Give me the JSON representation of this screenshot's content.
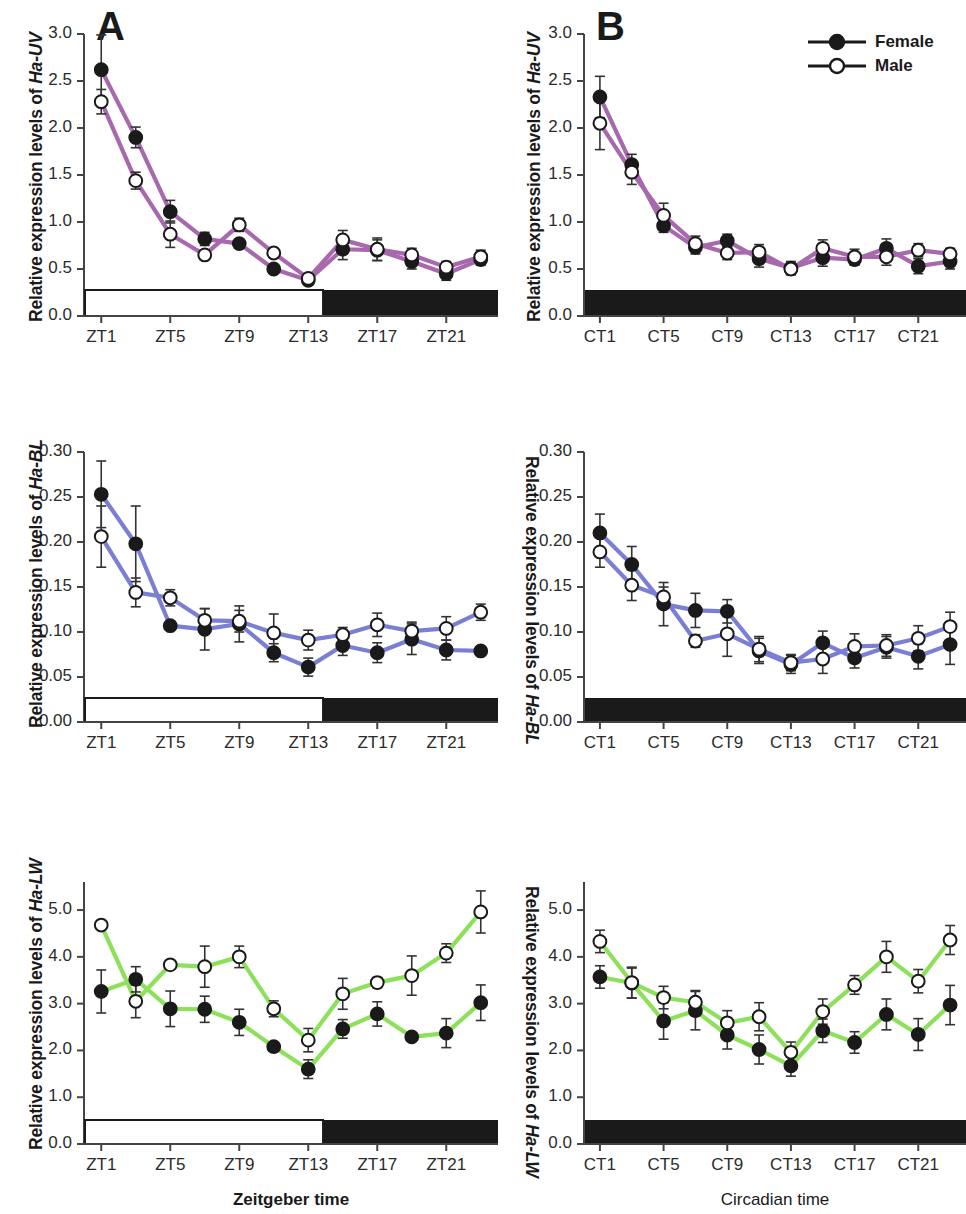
{
  "figure": {
    "panels": [
      {
        "id": "A",
        "letter": "A",
        "column": "left"
      },
      {
        "id": "B",
        "letter": "B",
        "column": "right"
      }
    ],
    "legend": {
      "position": "top-right of panel B",
      "entries": [
        {
          "label": "Female",
          "marker": "filled-circle"
        },
        {
          "label": "Male",
          "marker": "open-circle"
        }
      ]
    },
    "xlabels": {
      "left": "Zeitgeber time",
      "right": "Circadian time"
    },
    "ylabel_prefix": "Relative expression levels of"
  },
  "chart_data": [
    {
      "id": "A-UV",
      "type": "line",
      "panel": "A",
      "title": "",
      "gene": "Ha-UV",
      "ylabel": "Relative expression levels of Ha-UV",
      "xlabel": "Zeitgeber time",
      "line_color": "#a868ad",
      "ylim": [
        0.0,
        3.0
      ],
      "yticks": [
        "0.0",
        "0.5",
        "1.0",
        "1.5",
        "2.0",
        "2.5",
        "3.0"
      ],
      "ytick_values": [
        0.0,
        0.5,
        1.0,
        1.5,
        2.0,
        2.5,
        3.0
      ],
      "x": [
        1,
        3,
        5,
        7,
        9,
        11,
        13,
        15,
        17,
        19,
        21,
        23
      ],
      "xtick_labels": [
        "ZT1",
        "ZT5",
        "ZT9",
        "ZT13",
        "ZT17",
        "ZT21"
      ],
      "xtick_values": [
        1,
        5,
        9,
        13,
        17,
        21
      ],
      "grid": false,
      "daybar": {
        "light_until": 13.8,
        "light_color": "#ffffff",
        "dark_color": "#1a1a1a"
      },
      "series": [
        {
          "name": "Female",
          "marker": "filled-circle",
          "values": [
            2.62,
            1.9,
            1.11,
            0.82,
            0.77,
            0.5,
            0.38,
            0.71,
            0.7,
            0.58,
            0.45,
            0.6
          ],
          "errors": [
            0.37,
            0.11,
            0.12,
            0.07,
            0.05,
            0.04,
            0.03,
            0.11,
            0.11,
            0.08,
            0.07,
            0.06
          ]
        },
        {
          "name": "Male",
          "marker": "open-circle",
          "values": [
            2.28,
            1.44,
            0.87,
            0.65,
            0.97,
            0.67,
            0.4,
            0.81,
            0.71,
            0.65,
            0.52,
            0.63
          ],
          "errors": [
            0.13,
            0.09,
            0.14,
            0.05,
            0.07,
            0.05,
            0.04,
            0.1,
            0.12,
            0.07,
            0.06,
            0.07
          ]
        }
      ]
    },
    {
      "id": "B-UV",
      "type": "line",
      "panel": "B",
      "gene": "Ha-UV",
      "ylabel": "Relative expression levels of Ha-UV",
      "xlabel": "Circadian time",
      "line_color": "#a868ad",
      "ylim": [
        0.0,
        3.0
      ],
      "yticks": [
        "0.0",
        "0.5",
        "1.0",
        "1.5",
        "2.0",
        "2.5",
        "3.0"
      ],
      "ytick_values": [
        0.0,
        0.5,
        1.0,
        1.5,
        2.0,
        2.5,
        3.0
      ],
      "x": [
        1,
        3,
        5,
        7,
        9,
        11,
        13,
        15,
        17,
        19,
        21,
        23
      ],
      "xtick_labels": [
        "CT1",
        "CT5",
        "CT9",
        "CT13",
        "CT17",
        "CT21"
      ],
      "xtick_values": [
        1,
        5,
        9,
        13,
        17,
        21
      ],
      "grid": false,
      "daybar": {
        "light_until": 0,
        "light_color": "#ffffff",
        "dark_color": "#1a1a1a"
      },
      "series": [
        {
          "name": "Female",
          "marker": "filled-circle",
          "values": [
            2.33,
            1.61,
            0.96,
            0.73,
            0.8,
            0.61,
            0.51,
            0.62,
            0.6,
            0.72,
            0.53,
            0.58
          ],
          "errors": [
            0.22,
            0.11,
            0.07,
            0.07,
            0.07,
            0.09,
            0.07,
            0.09,
            0.06,
            0.1,
            0.08,
            0.08
          ]
        },
        {
          "name": "Male",
          "marker": "open-circle",
          "values": [
            2.05,
            1.53,
            1.07,
            0.77,
            0.67,
            0.68,
            0.5,
            0.72,
            0.63,
            0.63,
            0.7,
            0.66
          ],
          "errors": [
            0.28,
            0.13,
            0.13,
            0.08,
            0.07,
            0.08,
            0.06,
            0.09,
            0.08,
            0.09,
            0.07,
            0.06
          ]
        }
      ]
    },
    {
      "id": "A-BL",
      "type": "line",
      "panel": "A",
      "gene": "Ha-BL",
      "ylabel": "Relative expression levels of Ha-BL",
      "xlabel": "Zeitgeber time",
      "line_color": "#7b7fd4",
      "ylim": [
        0.0,
        0.3
      ],
      "yticks": [
        "0.00",
        "0.05",
        "0.10",
        "0.15",
        "0.20",
        "0.25",
        "0.30"
      ],
      "ytick_values": [
        0.0,
        0.05,
        0.1,
        0.15,
        0.2,
        0.25,
        0.3
      ],
      "x": [
        1,
        3,
        5,
        7,
        9,
        11,
        13,
        15,
        17,
        19,
        21,
        23
      ],
      "xtick_labels": [
        "ZT1",
        "ZT5",
        "ZT9",
        "ZT13",
        "ZT17",
        "ZT21"
      ],
      "xtick_values": [
        1,
        5,
        9,
        13,
        17,
        21
      ],
      "grid": false,
      "daybar": {
        "light_until": 13.8,
        "light_color": "#ffffff",
        "dark_color": "#1a1a1a"
      },
      "series": [
        {
          "name": "Female",
          "marker": "filled-circle",
          "values": [
            0.253,
            0.198,
            0.107,
            0.103,
            0.109,
            0.077,
            0.061,
            0.085,
            0.077,
            0.092,
            0.08,
            0.079
          ],
          "errors": [
            0.037,
            0.042,
            0.004,
            0.023,
            0.02,
            0.01,
            0.01,
            0.011,
            0.011,
            0.017,
            0.011,
            0.004
          ]
        },
        {
          "name": "Male",
          "marker": "open-circle",
          "values": [
            0.206,
            0.144,
            0.138,
            0.113,
            0.112,
            0.099,
            0.091,
            0.097,
            0.108,
            0.101,
            0.104,
            0.122
          ],
          "errors": [
            0.034,
            0.016,
            0.009,
            0.013,
            0.012,
            0.021,
            0.011,
            0.008,
            0.013,
            0.01,
            0.013,
            0.009
          ]
        }
      ]
    },
    {
      "id": "B-BL",
      "type": "line",
      "panel": "B",
      "gene": "Ha-BL",
      "ylabel": "Relative expression levels of Ha-BL",
      "xlabel": "Circadian time",
      "line_color": "#7b7fd4",
      "ylim": [
        0.0,
        0.3
      ],
      "yticks": [
        "0.00",
        "0.05",
        "0.10",
        "0.15",
        "0.20",
        "0.25",
        "0.30"
      ],
      "ytick_values": [
        0.0,
        0.05,
        0.1,
        0.15,
        0.2,
        0.25,
        0.3
      ],
      "x": [
        1,
        3,
        5,
        7,
        9,
        11,
        13,
        15,
        17,
        19,
        21,
        23
      ],
      "xtick_labels": [
        "CT1",
        "CT5",
        "CT9",
        "CT13",
        "CT17",
        "CT21"
      ],
      "xtick_values": [
        1,
        5,
        9,
        13,
        17,
        21
      ],
      "grid": false,
      "daybar": {
        "light_until": 0,
        "light_color": "#ffffff",
        "dark_color": "#1a1a1a"
      },
      "series": [
        {
          "name": "Female",
          "marker": "filled-circle",
          "values": [
            0.21,
            0.175,
            0.131,
            0.124,
            0.123,
            0.079,
            0.064,
            0.088,
            0.071,
            0.083,
            0.073,
            0.086
          ],
          "errors": [
            0.021,
            0.02,
            0.024,
            0.019,
            0.013,
            0.014,
            0.01,
            0.013,
            0.011,
            0.012,
            0.014,
            0.022
          ]
        },
        {
          "name": "Male",
          "marker": "open-circle",
          "values": [
            0.189,
            0.152,
            0.139,
            0.09,
            0.098,
            0.081,
            0.066,
            0.07,
            0.084,
            0.085,
            0.093,
            0.106
          ],
          "errors": [
            0.017,
            0.017,
            0.011,
            0.007,
            0.025,
            0.014,
            0.009,
            0.016,
            0.014,
            0.012,
            0.014,
            0.016
          ]
        }
      ]
    },
    {
      "id": "A-LW",
      "type": "line",
      "panel": "A",
      "gene": "Ha-LW",
      "ylabel": "Relative expression levels of Ha-LW",
      "xlabel": "Zeitgeber time",
      "line_color": "#8ce05a",
      "ylim": [
        0.0,
        5.6
      ],
      "yticks": [
        "0.0",
        "1.0",
        "2.0",
        "3.0",
        "4.0",
        "5.0"
      ],
      "ytick_values": [
        0.0,
        1.0,
        2.0,
        3.0,
        4.0,
        5.0
      ],
      "x": [
        1,
        3,
        5,
        7,
        9,
        11,
        13,
        15,
        17,
        19,
        21,
        23
      ],
      "xtick_labels": [
        "ZT1",
        "ZT5",
        "ZT9",
        "ZT13",
        "ZT17",
        "ZT21"
      ],
      "xtick_values": [
        1,
        5,
        9,
        13,
        17,
        21
      ],
      "grid": false,
      "daybar": {
        "light_until": 13.8,
        "light_color": "#ffffff",
        "dark_color": "#1a1a1a"
      },
      "series": [
        {
          "name": "Female",
          "marker": "filled-circle",
          "values": [
            3.26,
            3.52,
            2.89,
            2.88,
            2.6,
            2.08,
            1.6,
            2.46,
            2.78,
            2.29,
            2.37,
            3.02
          ],
          "errors": [
            0.46,
            0.27,
            0.38,
            0.28,
            0.28,
            0.06,
            0.2,
            0.2,
            0.26,
            0.06,
            0.31,
            0.38
          ]
        },
        {
          "name": "Male",
          "marker": "open-circle",
          "values": [
            4.68,
            3.05,
            3.83,
            3.79,
            4.0,
            2.89,
            2.22,
            3.21,
            3.45,
            3.6,
            4.08,
            4.96
          ],
          "errors": [
            0.05,
            0.35,
            0.07,
            0.44,
            0.23,
            0.17,
            0.25,
            0.33,
            0.11,
            0.42,
            0.2,
            0.45
          ]
        }
      ]
    },
    {
      "id": "B-LW",
      "type": "line",
      "panel": "B",
      "gene": "Ha-LW",
      "ylabel": "Relative expression levels of Ha-LW",
      "xlabel": "Circadian time",
      "line_color": "#8ce05a",
      "ylim": [
        0.0,
        5.6
      ],
      "yticks": [
        "0.0",
        "1.0",
        "2.0",
        "3.0",
        "4.0",
        "5.0"
      ],
      "ytick_values": [
        0.0,
        1.0,
        2.0,
        3.0,
        4.0,
        5.0
      ],
      "x": [
        1,
        3,
        5,
        7,
        9,
        11,
        13,
        15,
        17,
        19,
        21,
        23
      ],
      "xtick_labels": [
        "CT1",
        "CT5",
        "CT9",
        "CT13",
        "CT17",
        "CT21"
      ],
      "xtick_values": [
        1,
        5,
        9,
        13,
        17,
        21
      ],
      "grid": false,
      "daybar": {
        "light_until": 0,
        "light_color": "#ffffff",
        "dark_color": "#1a1a1a"
      },
      "series": [
        {
          "name": "Female",
          "marker": "filled-circle",
          "values": [
            3.57,
            3.44,
            2.63,
            2.85,
            2.33,
            2.02,
            1.67,
            2.42,
            2.17,
            2.77,
            2.34,
            2.97
          ],
          "errors": [
            0.24,
            0.32,
            0.39,
            0.41,
            0.3,
            0.31,
            0.22,
            0.25,
            0.23,
            0.33,
            0.34,
            0.42
          ]
        },
        {
          "name": "Male",
          "marker": "open-circle",
          "values": [
            4.33,
            3.45,
            3.13,
            3.03,
            2.59,
            2.72,
            1.96,
            2.83,
            3.4,
            4.0,
            3.48,
            4.36
          ],
          "errors": [
            0.24,
            0.33,
            0.24,
            0.25,
            0.26,
            0.3,
            0.22,
            0.27,
            0.2,
            0.33,
            0.25,
            0.31
          ]
        }
      ]
    }
  ]
}
